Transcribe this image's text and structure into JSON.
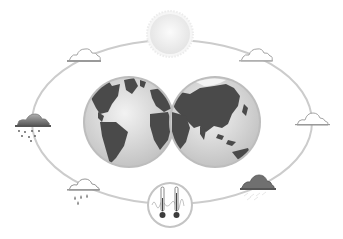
{
  "diagram": {
    "type": "climate-weather-cycle",
    "colors": {
      "background": "#ffffff",
      "orbit": "#c8c8c8",
      "land": "#4a4a4a",
      "ocean": "#d9d9d9",
      "globe_rim": "#bdbdbd",
      "sun": "#f2f2f2",
      "cloud_light": "#ffffff",
      "cloud_dark": "#6a6a6a",
      "thermometer_bulb": "#3c3c3c"
    },
    "elements": [
      {
        "id": "sun",
        "icon": "sun-icon",
        "position": "top"
      },
      {
        "id": "cloud-top-left",
        "icon": "cloud-icon",
        "position": "upper-left"
      },
      {
        "id": "cloud-top-right",
        "icon": "cloud-icon",
        "position": "upper-right"
      },
      {
        "id": "storm-cloud-left",
        "icon": "storm-cloud-icon",
        "position": "left"
      },
      {
        "id": "cloud-right",
        "icon": "cloud-icon",
        "position": "right"
      },
      {
        "id": "rain-cloud",
        "icon": "rain-cloud-icon",
        "position": "lower-left"
      },
      {
        "id": "dark-cloud",
        "icon": "dark-cloud-icon",
        "position": "lower-right"
      },
      {
        "id": "thermometers",
        "icon": "thermometer-icon",
        "position": "bottom"
      },
      {
        "id": "globe-western",
        "icon": "globe-americas-icon",
        "position": "center-left"
      },
      {
        "id": "globe-eastern",
        "icon": "globe-asia-icon",
        "position": "center-right"
      }
    ]
  }
}
